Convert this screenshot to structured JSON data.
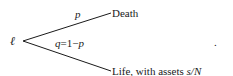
{
  "diagram": {
    "root": {
      "label": "ℓ"
    },
    "branches": [
      {
        "prob_label": "p",
        "outcome": "Death"
      },
      {
        "prob_label": "q = 1−p",
        "prob_var": "q",
        "prob_eq": "=1−",
        "prob_var2": "p",
        "outcome_text": "Life, with assets ",
        "outcome_math": "s/N"
      }
    ],
    "trailing_mark": "."
  }
}
